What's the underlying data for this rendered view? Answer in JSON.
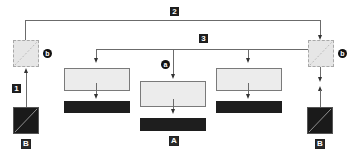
{
  "diagram": {
    "type": "block-diagram",
    "colors": {
      "line": "#6b6b6b",
      "light_box": "#ececec",
      "dark_block": "#1e1e1e",
      "dashed_box": "#e6e6e6"
    },
    "labels": {
      "path_1": "1",
      "path_2": "2",
      "path_3": "3",
      "node_a": "a",
      "node_b_left": "b",
      "node_b_right": "b",
      "source_b_left": "B",
      "source_b_right": "B",
      "target_a": "A"
    },
    "nodes": [
      {
        "id": "splitter-left",
        "kind": "dashed-box-diagonal",
        "label": "b"
      },
      {
        "id": "splitter-right",
        "kind": "dashed-box-diagonal",
        "label": "b"
      },
      {
        "id": "source-left",
        "kind": "dark-box-diagonal",
        "label": "B"
      },
      {
        "id": "source-right",
        "kind": "dark-box-diagonal",
        "label": "B"
      },
      {
        "id": "unit-left",
        "kind": "light-box-with-dark-bar"
      },
      {
        "id": "unit-center",
        "kind": "light-box-with-dark-bar",
        "label": "A"
      },
      {
        "id": "unit-right",
        "kind": "light-box-with-dark-bar"
      }
    ],
    "connections": [
      {
        "from": "source-left",
        "to": "splitter-left",
        "label": "1"
      },
      {
        "from": "splitter-left",
        "to": "splitter-right",
        "label": "2"
      },
      {
        "from": "splitter-right",
        "to": [
          "unit-left",
          "unit-center",
          "unit-right"
        ],
        "label": "3"
      },
      {
        "from": "source-right",
        "to": "splitter-right"
      },
      {
        "from": "splitter-right",
        "to": "source-right"
      }
    ]
  }
}
